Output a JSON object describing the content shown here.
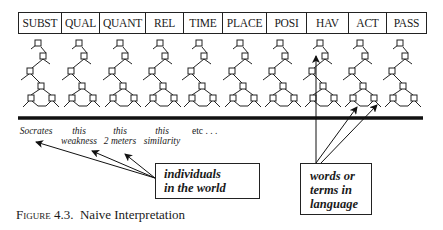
{
  "categories": [
    "SUBST",
    "QUAL",
    "QUANT",
    "REL",
    "TIME",
    "PLACE",
    "POSI",
    "HAV",
    "ACT",
    "PASS"
  ],
  "category_widths": [
    43,
    38,
    46,
    38,
    39,
    44,
    40,
    42,
    38,
    39
  ],
  "individuals": [
    {
      "line1": "Socrates",
      "line2": ""
    },
    {
      "line1": "this",
      "line2": "weakness"
    },
    {
      "line1": "this",
      "line2": "2 meters"
    },
    {
      "line1": "this",
      "line2": "similarity"
    }
  ],
  "etc_label": "etc . . .",
  "boxes": {
    "world": {
      "line1": "individuals",
      "line2": "in the world"
    },
    "language": {
      "line1": "words or",
      "line2": "terms in",
      "line3": "language"
    }
  },
  "caption": {
    "prefix": "Figure",
    "number": "4.3.",
    "title": "Naive Interpretation"
  },
  "colors": {
    "ink": "#1a1a1a",
    "background": "#ffffff"
  }
}
